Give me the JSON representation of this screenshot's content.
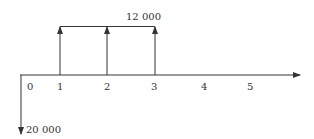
{
  "diagram": {
    "type": "cash-flow",
    "periods": [
      "0",
      "1",
      "2",
      "3",
      "4",
      "5"
    ],
    "outflow": {
      "period": "0",
      "amount_label": "20 000"
    },
    "inflows": {
      "periods": [
        "1",
        "2",
        "3"
      ],
      "amount_label": "12 000"
    },
    "colors": {
      "line": "#333333",
      "background": "#ffffff"
    }
  }
}
